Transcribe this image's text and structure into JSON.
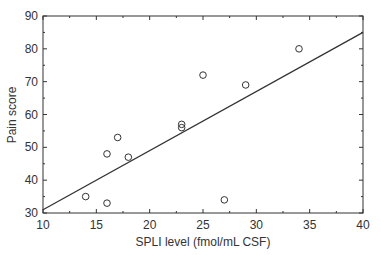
{
  "chart_data": {
    "type": "scatter",
    "title": "",
    "xlabel": "SPLI level (fmol/mL CSF)",
    "ylabel": "Pain score",
    "xlim": [
      10,
      40
    ],
    "ylim": [
      30,
      90
    ],
    "xticks": [
      10,
      15,
      20,
      25,
      30,
      35,
      40
    ],
    "yticks": [
      30,
      40,
      50,
      60,
      70,
      80,
      90
    ],
    "grid": false,
    "legend": null,
    "points": [
      {
        "x": 14,
        "y": 35
      },
      {
        "x": 16,
        "y": 33
      },
      {
        "x": 16,
        "y": 48
      },
      {
        "x": 17,
        "y": 53
      },
      {
        "x": 18,
        "y": 47
      },
      {
        "x": 23,
        "y": 57
      },
      {
        "x": 23,
        "y": 56
      },
      {
        "x": 25,
        "y": 72
      },
      {
        "x": 27,
        "y": 34
      },
      {
        "x": 29,
        "y": 69
      },
      {
        "x": 34,
        "y": 80
      }
    ],
    "fit_line": {
      "x": [
        10,
        40
      ],
      "y": [
        31,
        85
      ]
    }
  }
}
